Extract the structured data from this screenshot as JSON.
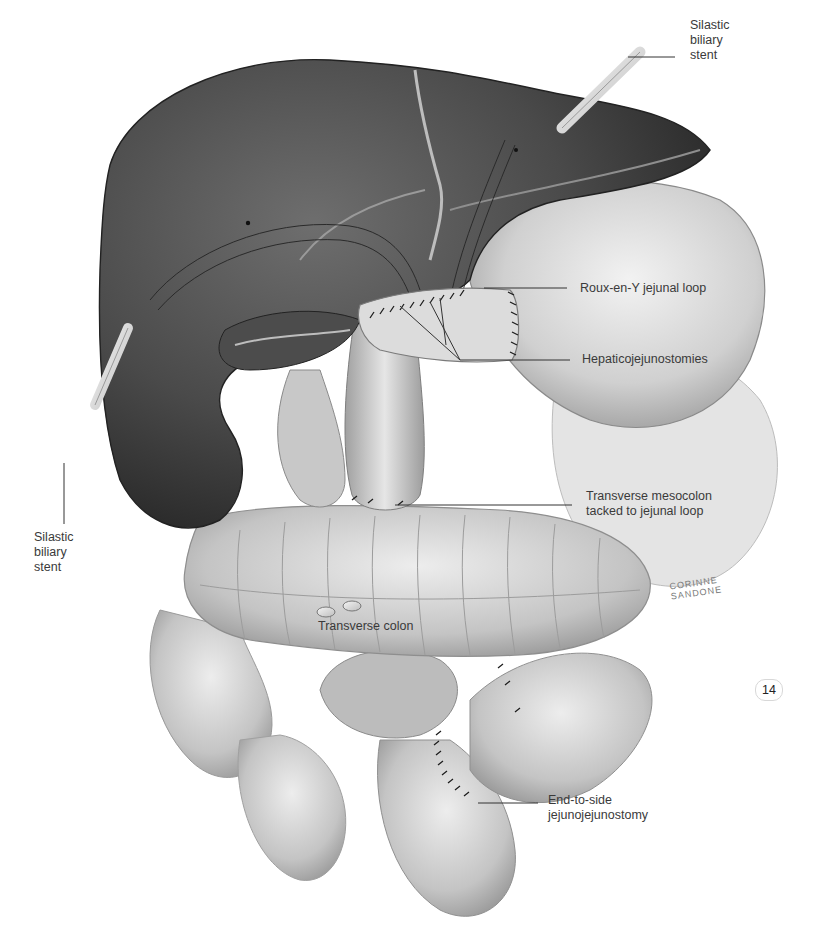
{
  "figure": {
    "type": "surgical-illustration",
    "color_scheme": "grayscale",
    "page_number": "14",
    "signature": "CORINNE\nSANDONE"
  },
  "labels": {
    "stent_top": "Silastic\nbiliary\nstent",
    "stent_left": "Silastic\nbiliary\nstent",
    "roux_loop": "Roux-en-Y jejunal loop",
    "hepaticojejunostomies": "Hepaticojejunostomies",
    "mesocolon": "Transverse mesocolon\ntacked to jejunal loop",
    "transverse_colon": "Transverse colon",
    "jejunojejunostomy": "End-to-side\njejunojejunostomy"
  },
  "colors": {
    "liver_dark": "#3c3c3c",
    "liver_mid": "#5a5a5a",
    "organ_light": "#d9d9d9",
    "organ_mid": "#b5b5b5",
    "label_text": "#3a3a3a",
    "leader_line": "#333333"
  }
}
